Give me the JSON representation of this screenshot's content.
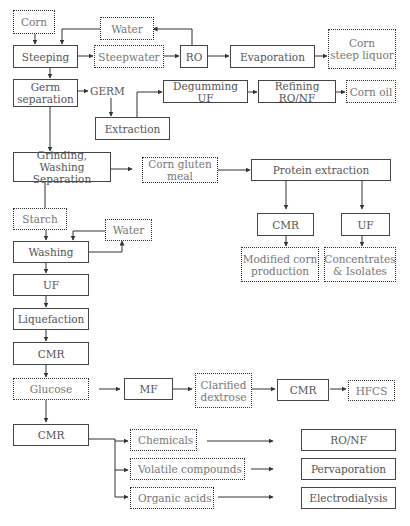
{
  "diagram": {
    "nodes": {
      "corn": "Corn",
      "water_top": "Water",
      "steeping": "Steeping",
      "steepwater": "Steepwater",
      "ro": "RO",
      "evaporation": "Evaporation",
      "corn_steep_liquor": "Corn\nsteep liquor",
      "germ_separation": "Germ\nseparation",
      "germ": "GERM",
      "degumming_uf": "Degumming UF",
      "refining_ronf": "Refining RO/NF",
      "corn_oil": "Corn oil",
      "extraction": "Extraction",
      "grinding": "Grinding, Washing\nSeparation",
      "corn_gluten_meal": "Corn gluten\nmeal",
      "protein_extraction": "Protein extraction",
      "cmr_protein": "CMR",
      "uf_protein": "UF",
      "modified_corn": "Modified corn\nproduction",
      "concentrates": "Concentrates\n& Isolates",
      "starch": "Starch",
      "water_mid": "Water",
      "washing": "Washing",
      "uf_main": "UF",
      "liquefaction": "Liquefaction",
      "cmr_main": "CMR",
      "glucose": "Glucose",
      "mf": "MF",
      "clarified_dextrose": "Clarified\ndextrose",
      "cmr_dextrose": "CMR",
      "hfcs": "HFCS",
      "cmr_bottom": "CMR",
      "chemicals": "Chemicals",
      "volatile": "Volatile compounds",
      "organic_acids": "Organic acids",
      "ronf_bottom": "RO/NF",
      "pervaporation": "Pervaporation",
      "electrodialysis": "Electrodialysis"
    }
  }
}
